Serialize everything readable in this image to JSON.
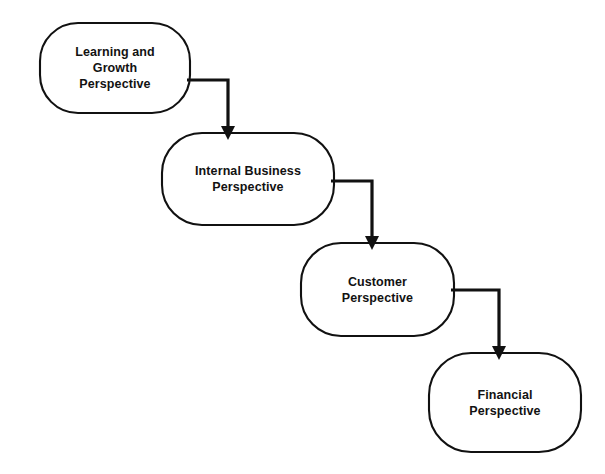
{
  "diagram": {
    "type": "flow-cascade",
    "background_color": "#ffffff",
    "stroke_color": "#111111",
    "text_color": "#121212",
    "direction": "top-left to bottom-right cascade",
    "nodes": [
      {
        "id": "learning-and-growth",
        "label": "Learning  and\nGrowth\nPerspective",
        "shape": "rounded-rectangle",
        "x": 40,
        "y": 23,
        "width": 150,
        "height": 90,
        "radius": 38
      },
      {
        "id": "internal-business",
        "label": "Internal  Business\nPerspective",
        "shape": "rounded-rectangle",
        "x": 162,
        "y": 133,
        "width": 172,
        "height": 92,
        "radius": 40
      },
      {
        "id": "customer",
        "label": "Customer\nPerspective",
        "shape": "rounded-rectangle",
        "x": 301,
        "y": 243,
        "width": 153,
        "height": 93,
        "radius": 40
      },
      {
        "id": "financial",
        "label": "Financial\nPerspective",
        "shape": "rounded-rectangle",
        "x": 429,
        "y": 353,
        "width": 152,
        "height": 99,
        "radius": 42
      }
    ],
    "connectors": [
      {
        "id": "learning-to-internal",
        "from": "learning-and-growth",
        "to": "internal-business",
        "style": "elbow-right-then-down",
        "arrowhead": "filled-triangle",
        "path": "M 187 80 L 228 80 L 228 127",
        "head": "222,126 234,126 228,139"
      },
      {
        "id": "internal-to-customer",
        "from": "internal-business",
        "to": "customer",
        "style": "elbow-right-then-down",
        "arrowhead": "filled-triangle",
        "path": "M 331 181 L 372 181 L 372 237",
        "head": "366,236 378,236 372,249"
      },
      {
        "id": "customer-to-financial",
        "from": "customer",
        "to": "financial",
        "style": "elbow-right-then-down",
        "arrowhead": "filled-triangle",
        "path": "M 451 290 L 499 290 L 499 347",
        "head": "493,346 505,346 499,359"
      }
    ]
  }
}
